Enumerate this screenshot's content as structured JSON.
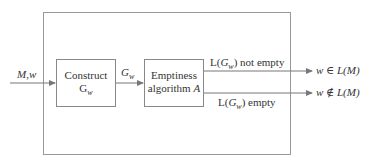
{
  "diagram": {
    "input_label": "M,w",
    "box1": {
      "line1": "Construct",
      "line2_main": "G",
      "line2_sub": "w"
    },
    "edge_label": {
      "main": "G",
      "sub": "w"
    },
    "box2": {
      "line1": "Emptiness",
      "line2_text": "algorithm ",
      "line2_var": "A"
    },
    "branch_top": {
      "prefix": "L(",
      "var": "G",
      "sub": "w",
      "suffix": ") not empty"
    },
    "branch_bottom": {
      "prefix": "L(",
      "var": "G",
      "sub": "w",
      "suffix": ") empty"
    },
    "output_top": {
      "w": "w",
      "rel": " ∈ ",
      "lang": "L(M)"
    },
    "output_bottom": {
      "w": "w",
      "rel": " ∉ ",
      "lang": "L(M)"
    },
    "colors": {
      "stroke": "#888888",
      "text": "#333333"
    }
  }
}
